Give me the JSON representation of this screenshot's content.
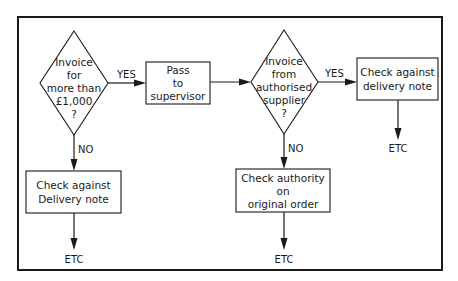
{
  "diagram": {
    "type": "flowchart",
    "decision1": {
      "lines": [
        "Invoice",
        "for",
        "more than",
        "£1,000",
        "?"
      ],
      "yes_label": "YES",
      "no_label": "NO"
    },
    "pass_box": {
      "lines": [
        "Pass",
        "to",
        "supervisor"
      ]
    },
    "decision2": {
      "lines": [
        "Invoice",
        "from",
        "authorised",
        "supplier",
        "?"
      ],
      "yes_label": "YES",
      "no_label": "NO"
    },
    "check_delivery_right": {
      "lines": [
        "Check against",
        "delivery note"
      ]
    },
    "check_delivery_left": {
      "lines": [
        "Check against",
        "Delivery note"
      ]
    },
    "check_authority": {
      "lines": [
        "Check authority",
        "on",
        "original order"
      ]
    },
    "terminals": {
      "left": "ETC",
      "middle": "ETC",
      "right": "ETC"
    }
  }
}
